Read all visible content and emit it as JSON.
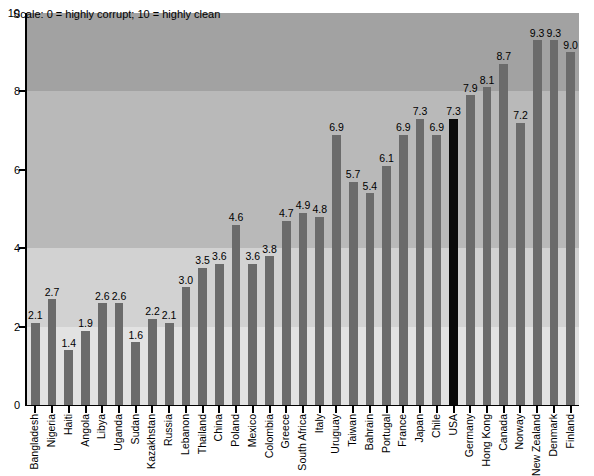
{
  "note": "Scale: 0 = highly corrupt; 10 = highly clean",
  "axis": {
    "y_ticks": [
      "0",
      "2",
      "4",
      "6",
      "8",
      "10"
    ]
  },
  "colors": {
    "bar": "#6b6b6b",
    "highlight_bar": "#0a0a0a",
    "band_lightest": "#e2e2e2",
    "band_light": "#d2d2d2",
    "band_mid": "#b9b9b9",
    "band_dark": "#a2a2a2",
    "axis": "#000000"
  },
  "chart_data": {
    "type": "bar",
    "title": "",
    "subtitle": "",
    "xlabel": "",
    "ylabel": "",
    "ylim": [
      0,
      10
    ],
    "yticks": [
      0,
      2,
      4,
      6,
      8,
      10
    ],
    "grid": false,
    "legend": "none",
    "annotations": [
      "Scale: 0 = highly corrupt; 10 = highly clean"
    ],
    "highlight_category": "USA",
    "categories": [
      "Bangladesh",
      "Nigeria",
      "Haiti",
      "Angola",
      "Libya",
      "Uganda",
      "Sudan",
      "Kazakhstan",
      "Russia",
      "Lebanon",
      "Thailand",
      "China",
      "Poland",
      "Mexico",
      "Colombia",
      "Greece",
      "South Africa",
      "Italy",
      "Uruguay",
      "Taiwan",
      "Bahrain",
      "Portugal",
      "France",
      "Japan",
      "Chile",
      "USA",
      "Germany",
      "Hong Kong",
      "Canada",
      "Norway",
      "New Zealand",
      "Denmark",
      "Finland"
    ],
    "values": [
      2.1,
      2.7,
      1.4,
      1.9,
      2.6,
      2.6,
      1.6,
      2.2,
      2.1,
      3.0,
      3.5,
      3.6,
      4.6,
      3.6,
      3.8,
      4.7,
      4.9,
      4.8,
      6.9,
      5.7,
      5.4,
      6.1,
      6.9,
      7.3,
      6.9,
      7.3,
      7.9,
      8.1,
      8.7,
      7.2,
      9.3,
      9.3,
      9.0
    ],
    "value_labels": [
      "2.1",
      "2.7",
      "1.4",
      "1.9",
      "2.6",
      "2.6",
      "1.6",
      "2.2",
      "2.1",
      "3.0",
      "3.5",
      "3.6",
      "4.6",
      "3.6",
      "3.8",
      "4.7",
      "4.9",
      "4.8",
      "6.9",
      "5.7",
      "5.4",
      "6.1",
      "6.9",
      "7.3",
      "6.9",
      "7.3",
      "7.9",
      "8.1",
      "8.7",
      "7.2",
      "9.3",
      "9.3",
      "9.0"
    ]
  }
}
